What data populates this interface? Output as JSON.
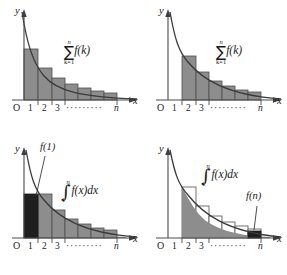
{
  "figure": {
    "panel_count": 4,
    "colors": {
      "bar_gray": "#8d8d8d",
      "bar_dark": "#1f1f1f",
      "bar_open": "#ffffff",
      "curve": "#3a3a3a",
      "axis": "#4a4a4a",
      "background": "#ffffff"
    }
  },
  "axis_labels": {
    "y": "y",
    "x": "x",
    "origin": "O",
    "ticks": [
      "1",
      "2",
      "3"
    ],
    "ellipsis": "·········",
    "last_tick": "n"
  },
  "panels": [
    {
      "id": "top-left",
      "name": "upper-sum-panel",
      "formula": {
        "kind": "summation",
        "upper": "n",
        "symbol": "∑",
        "lower": "k=1",
        "body": "f(k)"
      },
      "bars": {
        "style": "gray",
        "alignment": "left-endpoint",
        "start_x": 0,
        "description": "Rectangles of width 1 with height f at the left endpoint, from x=0 to x=n, rising above the curve."
      },
      "point_labels": []
    },
    {
      "id": "top-right",
      "name": "lower-sum-panel",
      "formula": {
        "kind": "summation",
        "upper": "n",
        "symbol": "∑",
        "lower": "k=1",
        "body": "f(k)"
      },
      "bars": {
        "style": "gray",
        "alignment": "right-endpoint",
        "start_x": 1,
        "description": "Rectangles of width 1 with height f at the left endpoint starting at x=1, lying under the curve."
      },
      "point_labels": []
    },
    {
      "id": "bottom-left",
      "name": "integral-lower-bound-panel",
      "formula": {
        "kind": "integral",
        "upper": "n",
        "symbol": "∫",
        "lower": "1",
        "body": "f(x)dx"
      },
      "bars": {
        "style": "gray-with-dark-first",
        "alignment": "right-endpoint",
        "start_x": 1,
        "description": "Gray area under the curve plus gray step rectangles; the first block from x=0 to x=1 is solid dark."
      },
      "point_labels": [
        {
          "text": "f(1)",
          "name": "f-of-1-label",
          "target": "first dark bar at x between 0 and 1"
        }
      ]
    },
    {
      "id": "bottom-right",
      "name": "integral-upper-bound-panel",
      "formula": {
        "kind": "integral",
        "upper": "n",
        "symbol": "∫",
        "lower": "1",
        "body": "f(x)dx"
      },
      "bars": {
        "style": "open-outline",
        "alignment": "left-endpoint",
        "start_x": 1,
        "description": "Open (unfilled) rectangles above the gray shaded area under the curve; the block at the last interval ending at n is solid dark."
      },
      "point_labels": [
        {
          "text": "f(n)",
          "name": "f-of-n-label",
          "target": "dark bar at the last interval before n"
        }
      ]
    }
  ]
}
